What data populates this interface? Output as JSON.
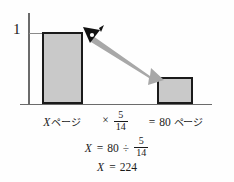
{
  "diagram": {
    "type": "bar-comparison-with-arrow",
    "axis": {
      "y_tick_label": "1",
      "y_axis_name": "y-axis",
      "x_axis_name": "x-axis"
    },
    "bars": [
      {
        "name": "left-bar",
        "label": "Xページ",
        "value": 1,
        "height_px": 72
      },
      {
        "name": "right-bar",
        "label": "= 80 ページ",
        "value": 0.357,
        "height_px": 27
      }
    ],
    "arrow": {
      "name": "reduction-arrow",
      "color": "#a8a8a8",
      "from": "top of left bar",
      "to": "top of right bar"
    },
    "pointer_icon": "pointer-nib-icon"
  },
  "labels": {
    "left": {
      "var": "X",
      "unit": "ページ"
    },
    "multiply": {
      "operator": "×",
      "numerator": "5",
      "denominator": "14"
    },
    "right": {
      "equals": "=",
      "value": "80",
      "unit": "ページ"
    }
  },
  "equations": {
    "line2": {
      "var": "X",
      "equals": "=",
      "value": "80",
      "operator": "÷",
      "numerator": "5",
      "denominator": "14"
    },
    "line3": {
      "var": "X",
      "equals": "=",
      "value": "224"
    }
  },
  "colors": {
    "bar_fill": "#c9c9c9",
    "bar_border": "#1a1a1a",
    "axis": "#6b6b6b",
    "arrow": "#a8a8a8",
    "text": "#1a1a1a",
    "background": "#fefefe"
  }
}
